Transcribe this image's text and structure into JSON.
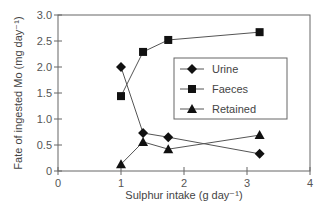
{
  "chart_data": {
    "type": "line",
    "title": "",
    "xlabel": "Sulphur intake (g day⁻¹)",
    "ylabel": "Fate of ingested Mo (mg day⁻¹)",
    "xlim": [
      0,
      4
    ],
    "ylim": [
      0,
      3.0
    ],
    "xticks": [
      "0",
      "1",
      "2",
      "3",
      "4"
    ],
    "yticks": [
      "0",
      "0.5",
      "1.0",
      "1.5",
      "2.0",
      "2.5",
      "3.0"
    ],
    "grid": false,
    "legend_position": "center-right inside plot",
    "x": [
      1.0,
      1.35,
      1.75,
      3.2
    ],
    "series": [
      {
        "name": "Urine",
        "marker": "diamond",
        "values": [
          2.0,
          0.73,
          0.65,
          0.33
        ]
      },
      {
        "name": "Faeces",
        "marker": "square",
        "values": [
          1.44,
          2.29,
          2.52,
          2.67
        ]
      },
      {
        "name": "Retained",
        "marker": "triangle",
        "values": [
          0.13,
          0.56,
          0.42,
          0.69
        ]
      }
    ]
  },
  "colors": {
    "line": "#555555",
    "marker": "#111111",
    "axis": "#666666"
  }
}
